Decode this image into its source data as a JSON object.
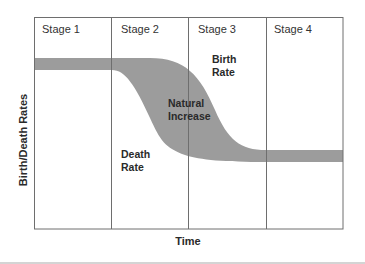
{
  "diagram": {
    "stages": [
      "Stage 1",
      "Stage 2",
      "Stage 3",
      "Stage 4"
    ],
    "x_axis_label": "Time",
    "y_axis_label": "Birth/Death Rates",
    "annotations": {
      "birth_rate": [
        "Birth",
        "Rate"
      ],
      "death_rate": [
        "Death",
        "Rate"
      ],
      "natural_increase": [
        "Natural",
        "Increase"
      ]
    },
    "colors": {
      "band_fill": "#9c9c9c",
      "frame": "#6e6e6e",
      "text": "#2a2a2a"
    }
  }
}
